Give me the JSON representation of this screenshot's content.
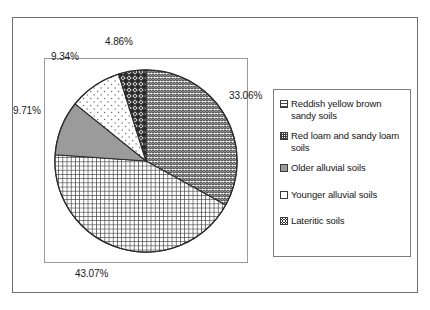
{
  "chart_data": {
    "type": "pie",
    "title": "",
    "subtitle": "",
    "xlabel": "",
    "ylabel": "",
    "grid": false,
    "legend_position": "right",
    "label_format": "percent",
    "categories": [
      "Reddish yellow brown sandy soils",
      "Red loam and sandy loam soils",
      "Older alluvial soils",
      "Younger alluvial soils",
      "Lateritic soils"
    ],
    "values": [
      33.06,
      43.07,
      9.71,
      9.34,
      4.86
    ],
    "value_labels": [
      "33.06%",
      "43.07%",
      "9.71%",
      "9.34%",
      "4.86%"
    ],
    "slices": [
      {
        "label": "Reddish yellow brown sandy soils",
        "value": 33.06,
        "display": "33.06%",
        "fill": "wavy-horizontal-lines",
        "color": "#6a6a6a",
        "start_deg": 0,
        "end_deg": 119.016
      },
      {
        "label": "Red loam and sandy loam soils",
        "value": 43.07,
        "display": "43.07%",
        "fill": "fine-cross-hatch-grid",
        "color": "#4a4a4a",
        "start_deg": 119.016,
        "end_deg": 274.068
      },
      {
        "label": "Older alluvial soils",
        "value": 9.71,
        "display": "9.71%",
        "fill": "solid-gray",
        "color": "#9b9b9b",
        "start_deg": 274.068,
        "end_deg": 309.024
      },
      {
        "label": "Younger alluvial soils",
        "value": 9.34,
        "display": "9.34%",
        "fill": "light-sparse-dots",
        "color": "#ffffff",
        "start_deg": 309.024,
        "end_deg": 342.648
      },
      {
        "label": "Lateritic soils",
        "value": 4.86,
        "display": "4.86%",
        "fill": "dark-diamond-checker",
        "color": "#2e2e2e",
        "start_deg": 342.648,
        "end_deg": 360
      }
    ]
  },
  "plot": {
    "labels": {
      "top": "4.86%",
      "upper_left": "9.34%",
      "left": "9.71%",
      "right": "33.06%",
      "bottom": "43.07%"
    }
  },
  "legend": {
    "items": [
      {
        "label": "Reddish yellow brown sandy soils",
        "swatch": "wavy-horizontal-lines"
      },
      {
        "label": "Red loam and sandy loam soils",
        "swatch": "fine-cross-hatch-grid"
      },
      {
        "label": "Older alluvial soils",
        "swatch": "solid-gray"
      },
      {
        "label": "Younger alluvial soils",
        "swatch": "light-sparse-dots"
      },
      {
        "label": "Lateritic soils",
        "swatch": "dark-diamond-checker"
      }
    ]
  }
}
